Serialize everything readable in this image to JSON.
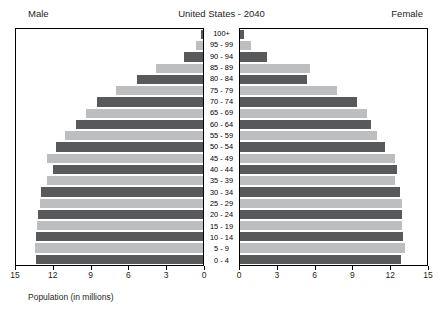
{
  "header": {
    "title": "United States - 2040",
    "male_label": "Male",
    "female_label": "Female"
  },
  "axis": {
    "label": "Population (in millions)",
    "left_ticks": [
      "15",
      "12",
      "9",
      "6",
      "3",
      "0"
    ],
    "right_ticks": [
      "0",
      "3",
      "6",
      "9",
      "12",
      "15"
    ]
  },
  "colors": {
    "dark_bar": "#58595b",
    "light_bar": "#bcbec0",
    "frame": "#000000",
    "text": "#231f20",
    "background": "#ffffff"
  },
  "chart_data": {
    "type": "bar",
    "subtype": "population-pyramid",
    "title": "United States - 2040",
    "xlabel": "Population (in millions)",
    "ylabel": "",
    "xlim": [
      0,
      15
    ],
    "grid": false,
    "legend": "none",
    "categories": [
      "100+",
      "95 - 99",
      "90 - 94",
      "85 - 89",
      "80 - 84",
      "75 - 79",
      "70 - 74",
      "65 - 69",
      "60 - 64",
      "55 - 59",
      "50 - 54",
      "45 - 49",
      "40 - 44",
      "35 - 39",
      "30 - 34",
      "25 - 29",
      "20 - 24",
      "15 - 19",
      "10 - 14",
      "5 - 9",
      "0 - 4"
    ],
    "series": [
      {
        "name": "Male",
        "side": "left",
        "values": [
          0.2,
          0.6,
          1.5,
          3.8,
          5.3,
          7.0,
          8.5,
          9.4,
          10.2,
          11.1,
          11.8,
          12.5,
          12.0,
          12.5,
          13.0,
          13.1,
          13.2,
          13.3,
          13.4,
          13.5,
          13.4
        ]
      },
      {
        "name": "Female",
        "side": "right",
        "values": [
          0.3,
          0.9,
          2.2,
          5.6,
          5.4,
          7.8,
          9.4,
          10.2,
          10.5,
          11.0,
          11.6,
          12.4,
          12.6,
          12.4,
          12.8,
          13.0,
          13.0,
          13.0,
          13.1,
          13.2,
          12.9
        ]
      }
    ]
  }
}
